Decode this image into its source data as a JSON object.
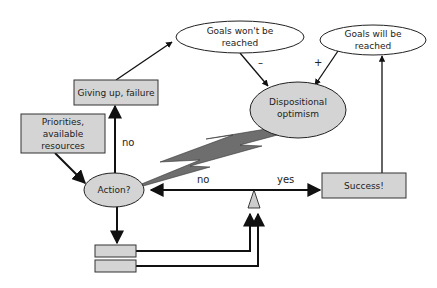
{
  "diagram": {
    "nodes": {
      "goals_wont": {
        "line1": "Goals won't be",
        "line2": "reached"
      },
      "goals_will": {
        "line1": "Goals will be",
        "line2": "reached"
      },
      "giving_up": {
        "label": "Giving up, failure"
      },
      "priorities": {
        "line1": "Priorities,",
        "line2": "available",
        "line3": "resources"
      },
      "optimism": {
        "line1": "Dispositional",
        "line2": "optimism"
      },
      "action": {
        "label": "Action?"
      },
      "success": {
        "label": "Success!"
      }
    },
    "edges": {
      "minus": "–",
      "plus": "+",
      "no_up": "no",
      "no_left": "no",
      "yes": "yes"
    },
    "colors": {
      "box_fill": "#d4d4d4",
      "ellipse_fill": "#d4d4d4",
      "bolt_fill": "#6e6e6e",
      "line": "#111111",
      "triangle_fill": "#cccccc"
    }
  }
}
